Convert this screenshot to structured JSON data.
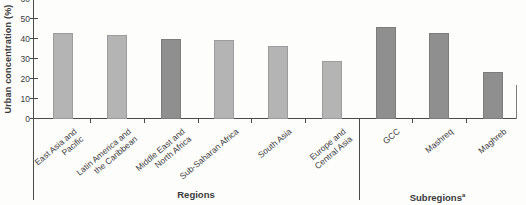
{
  "chart_data": {
    "type": "bar",
    "title": "",
    "ylabel": "Urban concentration (%)",
    "xlabel": "",
    "ylim": [
      0,
      60
    ],
    "yticks": [
      0,
      10,
      20,
      30,
      40,
      50,
      60
    ],
    "grid": false,
    "legend": null,
    "groups": [
      {
        "label": "Regions"
      },
      {
        "label": "Subregions",
        "superscript": "a"
      }
    ],
    "bars": [
      {
        "label": "East Asia and Pacific",
        "label_lines": [
          "East Asia and",
          "Pacific"
        ],
        "group": "Regions",
        "value": 43,
        "shade": "light"
      },
      {
        "label": "Latin America and the Caribbean",
        "label_lines": [
          "Latin America and",
          "the Caribbean"
        ],
        "group": "Regions",
        "value": 42,
        "shade": "light"
      },
      {
        "label": "Middle East and North Africa",
        "label_lines": [
          "Middle East and",
          "North Africa"
        ],
        "group": "Regions",
        "value": 40,
        "shade": "dark"
      },
      {
        "label": "Sub-Saharan Africa",
        "label_lines": [
          "Sub-Saharan Africa"
        ],
        "group": "Regions",
        "value": 39.5,
        "shade": "light"
      },
      {
        "label": "South Asia",
        "label_lines": [
          "South Asia"
        ],
        "group": "Regions",
        "value": 36.5,
        "shade": "light"
      },
      {
        "label": "Europe and Central Asia",
        "label_lines": [
          "Europe and",
          "Central Asia"
        ],
        "group": "Regions",
        "value": 29,
        "shade": "light"
      },
      {
        "label": "GCC",
        "label_lines": [
          "GCC"
        ],
        "group": "Subregions",
        "value": 46,
        "shade": "dark"
      },
      {
        "label": "Mashreq",
        "label_lines": [
          "Mashreq"
        ],
        "group": "Subregions",
        "value": 43,
        "shade": "dark"
      },
      {
        "label": "Maghreb",
        "label_lines": [
          "Maghreb"
        ],
        "group": "Subregions",
        "value": 23.5,
        "shade": "dark"
      }
    ],
    "colors": {
      "bar_light": "#b4b4b4",
      "bar_dark": "#8f8f8f",
      "axis": "#4a4a4a",
      "text": "#3a3a3a"
    }
  }
}
